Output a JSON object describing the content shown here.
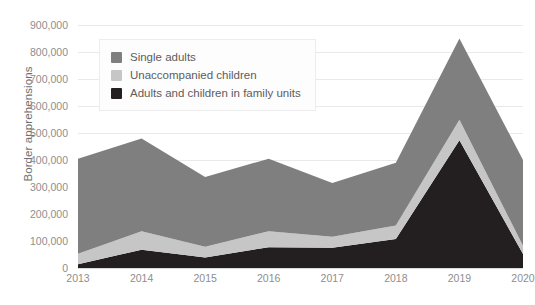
{
  "chart_data": {
    "type": "area",
    "stacked": true,
    "title": "",
    "xlabel": "",
    "ylabel": "Border apprehensions",
    "categories": [
      "2013",
      "2014",
      "2015",
      "2016",
      "2017",
      "2018",
      "2019",
      "2020"
    ],
    "ylim": [
      0,
      900000
    ],
    "ytick_values": [
      0,
      100000,
      200000,
      300000,
      400000,
      500000,
      600000,
      700000,
      800000,
      900000
    ],
    "ytick_labels": [
      "0",
      "100,000",
      "200,000",
      "300,000",
      "400,000",
      "500,000",
      "600,000",
      "700,000",
      "800,000",
      "900,000"
    ],
    "grid": true,
    "legend_position": "top-left",
    "series": [
      {
        "name": "Adults and children in family units",
        "color": "#231f20",
        "values": [
          14000,
          68000,
          39000,
          77000,
          75000,
          107000,
          473000,
          52000
        ]
      },
      {
        "name": "Unaccompanied children",
        "color": "#c6c6c6",
        "values": [
          39000,
          68000,
          40000,
          59000,
          41000,
          50000,
          76000,
          30000
        ]
      },
      {
        "name": "Single adults",
        "color": "#7f7f7f",
        "values": [
          352000,
          344000,
          258000,
          269000,
          199000,
          233000,
          301000,
          318000
        ]
      }
    ],
    "totals": [
      405000,
      480000,
      337000,
      405000,
      315000,
      390000,
      850000,
      400000
    ]
  },
  "legend": {
    "items": [
      {
        "label": "Single adults",
        "color": "#7f7f7f"
      },
      {
        "label": "Unaccompanied children",
        "color": "#c6c6c6"
      },
      {
        "label": "Adults and children in family units",
        "color": "#231f20"
      }
    ]
  },
  "colors": {
    "single_adults": "#7f7f7f",
    "unaccompanied_children": "#c6c6c6",
    "family_units": "#231f20",
    "gridline": "#e9e9e9",
    "axis_text": "#8e8e8e"
  }
}
